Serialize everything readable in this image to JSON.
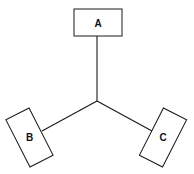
{
  "diagram": {
    "background_color": "#ffffff",
    "stroke_color": "#1a1a1a",
    "fill_color": "#ffffff",
    "canvas": {
      "width": 194,
      "height": 174
    },
    "hub": {
      "x": 97,
      "y": 101
    },
    "nodes": [
      {
        "id": "A",
        "label": "A",
        "cx": 98,
        "cy": 22.5,
        "width": 48,
        "height": 27,
        "rotation": 0,
        "label_x": 98,
        "label_y": 23
      },
      {
        "id": "B",
        "label": "B",
        "cx": 29.5,
        "cy": 137.5,
        "width": 26,
        "height": 53,
        "rotation": -27,
        "label_x": 30,
        "label_y": 137
      },
      {
        "id": "C",
        "label": "C",
        "cx": 163,
        "cy": 137.5,
        "width": 26,
        "height": 53,
        "rotation": 27,
        "label_x": 161,
        "label_y": 136
      }
    ],
    "edges": [
      {
        "id": "hub-a",
        "from": "hub",
        "to": "A",
        "x1": 97,
        "y1": 101,
        "x2": 97,
        "y2": 36
      },
      {
        "id": "hub-b",
        "from": "hub",
        "to": "B",
        "x1": 97,
        "y1": 101,
        "x2": 42,
        "y2": 131
      },
      {
        "id": "hub-c",
        "from": "hub",
        "to": "C",
        "x1": 97,
        "y1": 101,
        "x2": 152,
        "y2": 131
      }
    ]
  }
}
